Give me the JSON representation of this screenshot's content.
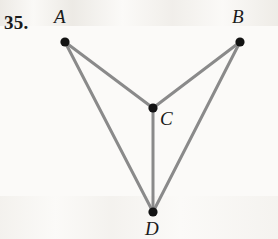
{
  "figure": {
    "problem_number": "35.",
    "background_color": "#fbfaf8",
    "edge_color": "#8a8a8a",
    "vertex_color": "#131313",
    "edge_width": 3,
    "vertex_radius": 4.6,
    "vertices": [
      {
        "id": "A",
        "label": "A",
        "x": 65,
        "y": 42
      },
      {
        "id": "B",
        "label": "B",
        "x": 240,
        "y": 42
      },
      {
        "id": "C",
        "label": "C",
        "x": 153,
        "y": 108
      },
      {
        "id": "D",
        "label": "D",
        "x": 153,
        "y": 212
      }
    ],
    "edges": [
      {
        "from": "A",
        "to": "C"
      },
      {
        "from": "A",
        "to": "D"
      },
      {
        "from": "B",
        "to": "C"
      },
      {
        "from": "B",
        "to": "D"
      },
      {
        "from": "C",
        "to": "D"
      }
    ],
    "labels": {
      "A": "A",
      "B": "B",
      "C": "C",
      "D": "D"
    }
  }
}
